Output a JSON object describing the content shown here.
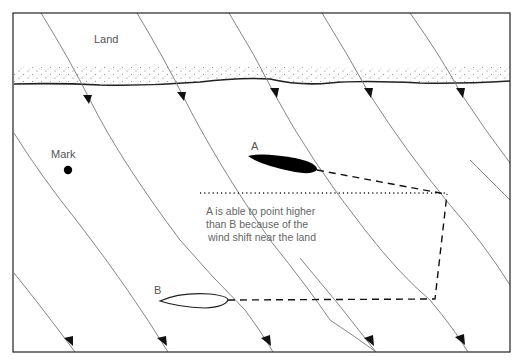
{
  "diagram": {
    "labels": {
      "land": "Land",
      "mark": "Mark",
      "boat_a": "A",
      "boat_b": "B"
    },
    "note": {
      "line1": "A is able to point higher",
      "line2": "than B  because of the",
      "line3": "wind shift near the land"
    },
    "colors": {
      "frame": "#222222",
      "wind_line": "#777777",
      "boat_a_fill": "#000000",
      "text": "#555555"
    }
  }
}
